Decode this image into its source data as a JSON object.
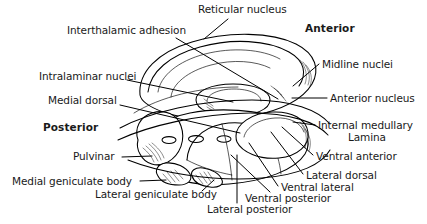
{
  "figure": {
    "background_color": "#ffffff",
    "line_color": "#000000",
    "text_color": "#1a1a1a",
    "width": 427,
    "height": 224
  },
  "orientation_labels": [
    {
      "id": "anterior",
      "text": "Anterior",
      "x": 305,
      "y": 23
    },
    {
      "id": "posterior",
      "text": "Posterior",
      "x": 43,
      "y": 122
    }
  ],
  "labels": [
    {
      "id": "interthalamic-adhesion",
      "text": "Interthalamic adhesion",
      "x": 67,
      "y": 25
    },
    {
      "id": "reticular-nucleus",
      "text": "Reticular nucleus",
      "x": 198,
      "y": 4
    },
    {
      "id": "intralaminar-nuclei",
      "text": "Intralaminar nuclei",
      "x": 39,
      "y": 71
    },
    {
      "id": "medial-dorsal",
      "text": "Medial dorsal",
      "x": 48,
      "y": 95
    },
    {
      "id": "midline-nuclei",
      "text": "Midline nuclei",
      "x": 322,
      "y": 59
    },
    {
      "id": "anterior-nucleus",
      "text": "Anterior nucleus",
      "x": 330,
      "y": 93
    },
    {
      "id": "internal-medullary-lamina-line1",
      "text": "Internal medullary",
      "x": 318,
      "y": 120
    },
    {
      "id": "internal-medullary-lamina-line2",
      "text": "Lamina",
      "x": 348,
      "y": 132
    },
    {
      "id": "ventral-anterior",
      "text": "Ventral anterior",
      "x": 316,
      "y": 151
    },
    {
      "id": "lateral-dorsal",
      "text": "Lateral dorsal",
      "x": 306,
      "y": 170
    },
    {
      "id": "ventral-lateral",
      "text": "Ventral lateral",
      "x": 281,
      "y": 182
    },
    {
      "id": "ventral-posterior",
      "text": "Ventral posterior",
      "x": 245,
      "y": 193
    },
    {
      "id": "lateral-posterior",
      "text": "Lateral posterior",
      "x": 207,
      "y": 204
    },
    {
      "id": "lateral-geniculate-body",
      "text": "Lateral geniculate body",
      "x": 95,
      "y": 189
    },
    {
      "id": "medial-geniculate-body",
      "text": "Medial geniculate body",
      "x": 12,
      "y": 176
    },
    {
      "id": "pulvinar",
      "text": "Pulvinar",
      "x": 73,
      "y": 151
    }
  ],
  "leader_lines": [
    {
      "id": "leader-interthalamic-adhesion",
      "from": [
        176,
        38
      ],
      "to": [
        278,
        99
      ]
    },
    {
      "id": "leader-reticular-nucleus",
      "from": [
        225,
        19
      ],
      "to": [
        205,
        38
      ]
    },
    {
      "id": "leader-intralaminar-nuclei",
      "from": [
        127,
        80
      ],
      "to": [
        232,
        101
      ]
    },
    {
      "id": "leader-medial-dorsal",
      "from": [
        120,
        105
      ],
      "to": [
        238,
        132
      ]
    },
    {
      "id": "leader-midline-nuclei",
      "from": [
        319,
        64
      ],
      "to": [
        296,
        85
      ]
    },
    {
      "id": "leader-anterior-nucleus",
      "from": [
        327,
        98
      ],
      "to": [
        297,
        98
      ]
    },
    {
      "id": "leader-internal-medullary",
      "from": [
        315,
        125
      ],
      "to": [
        296,
        121
      ]
    },
    {
      "id": "leader-ventral-anterior",
      "from": [
        313,
        155
      ],
      "to": [
        283,
        126
      ]
    },
    {
      "id": "leader-lateral-dorsal",
      "from": [
        303,
        174
      ],
      "to": [
        272,
        131
      ]
    },
    {
      "id": "leader-ventral-lateral",
      "from": [
        278,
        186
      ],
      "to": [
        250,
        142
      ]
    },
    {
      "id": "leader-ventral-posterior",
      "from": [
        270,
        192
      ],
      "to": [
        232,
        154
      ]
    },
    {
      "id": "leader-lateral-posterior",
      "from": [
        237,
        203
      ],
      "to": [
        237,
        155
      ]
    },
    {
      "id": "leader-lateral-geniculate-body",
      "from": [
        202,
        192
      ],
      "to": [
        215,
        180
      ]
    },
    {
      "id": "leader-medial-geniculate-body",
      "from": [
        140,
        181
      ],
      "to": [
        167,
        181
      ]
    },
    {
      "id": "leader-pulvinar",
      "from": [
        122,
        157
      ],
      "to": [
        152,
        157
      ]
    }
  ],
  "anatomy_parts": [
    "thalamus-dorsal-surface",
    "pulvinar-mass",
    "medial-geniculate-body-mass",
    "lateral-geniculate-body-mass",
    "anterior-nucleus-lobe",
    "ventral-nuclear-group",
    "internal-medullary-lamina-band"
  ]
}
